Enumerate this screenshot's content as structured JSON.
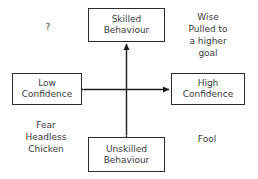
{
  "diagram": {
    "type": "2x2-quadrant-matrix",
    "background_color": "#ffffff",
    "line_color": "#2b2b2b",
    "text_color": "#3a3a3a",
    "nodes": [
      {
        "id": "skilled-behaviour",
        "label": "Skilled\nBehaviour",
        "position": "top"
      },
      {
        "id": "low-confidence",
        "label": "Low\nConfidence",
        "position": "left"
      },
      {
        "id": "high-confidence",
        "label": "High\nConfidence",
        "position": "right"
      },
      {
        "id": "unskilled-behaviour",
        "label": "Unskilled\nBehaviour",
        "position": "bottom"
      }
    ],
    "annotations": [
      {
        "id": "top-left",
        "text": "?",
        "quadrant": "skilled-behaviour / low-confidence"
      },
      {
        "id": "top-right",
        "text": "Wise\nPulled to\na higher\ngoal",
        "quadrant": "skilled-behaviour / high-confidence"
      },
      {
        "id": "bottom-left",
        "text": "Fear\nHeadless\nChicken",
        "quadrant": "unskilled-behaviour / low-confidence"
      },
      {
        "id": "bottom-right",
        "text": "Fool",
        "quadrant": "unskilled-behaviour / high-confidence"
      }
    ],
    "connectors": [
      {
        "id": "vertical-axis",
        "from": "unskilled-behaviour",
        "to": "skilled-behaviour",
        "style": "double-headed-arrow",
        "orientation": "vertical"
      },
      {
        "id": "horizontal-axis",
        "from": "low-confidence",
        "to": "high-confidence",
        "style": "double-headed-arrow",
        "orientation": "horizontal"
      }
    ]
  }
}
